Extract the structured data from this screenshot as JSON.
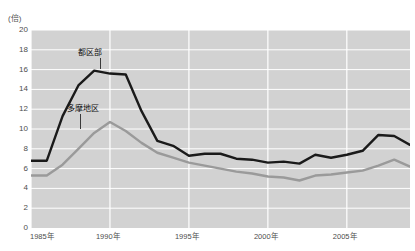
{
  "chart_data": {
    "type": "line",
    "title": "",
    "xlabel": "",
    "ylabel": "(倍)",
    "ylim": [
      0,
      20
    ],
    "xlim": [
      1985,
      2009
    ],
    "ytick_step": 2,
    "yticks": [
      "20",
      "18",
      "16",
      "14",
      "12",
      "10",
      "8",
      "6",
      "4",
      "2",
      "0"
    ],
    "xticks": [
      "1985年",
      "1990年",
      "1995年",
      "2000年",
      "2005年"
    ],
    "xtick_values": [
      1985,
      1990,
      1995,
      2000,
      2005
    ],
    "grid": true,
    "grid_color": "#ffffff",
    "plot_background": "#d2d2d2",
    "legend_position": "inline-annotation",
    "x": [
      1985,
      1986,
      1987,
      1988,
      1989,
      1990,
      1991,
      1992,
      1993,
      1994,
      1995,
      1996,
      1997,
      1998,
      1999,
      2000,
      2001,
      2002,
      2003,
      2004,
      2005,
      2006,
      2007,
      2008,
      2009
    ],
    "series": [
      {
        "name": "都区部",
        "color": "#1a1a1a",
        "values": [
          6.8,
          6.8,
          11.3,
          14.4,
          15.9,
          15.6,
          15.5,
          11.8,
          8.8,
          8.3,
          7.3,
          7.5,
          7.5,
          7.0,
          6.9,
          6.6,
          6.7,
          6.5,
          7.4,
          7.1,
          7.4,
          7.8,
          9.4,
          9.3,
          8.4
        ]
      },
      {
        "name": "多摩地区",
        "color": "#9a9a9a",
        "values": [
          5.3,
          5.3,
          6.4,
          8.0,
          9.6,
          10.7,
          9.8,
          8.6,
          7.6,
          7.1,
          6.6,
          6.3,
          6.0,
          5.7,
          5.5,
          5.2,
          5.1,
          4.8,
          5.3,
          5.4,
          5.6,
          5.8,
          6.3,
          6.9,
          6.2
        ]
      }
    ]
  },
  "annotations": [
    {
      "name": "toku-ku-bu",
      "label": "都区部"
    },
    {
      "name": "tama-chiku",
      "label": "多摩地区"
    }
  ]
}
